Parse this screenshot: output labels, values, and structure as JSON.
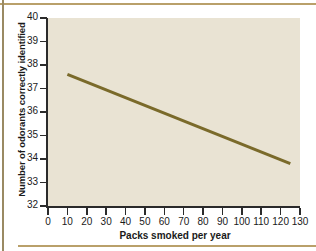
{
  "chart_data": {
    "type": "line",
    "title": "",
    "xlabel": "Packs smoked per year",
    "ylabel": "Number of odorants correctly identified",
    "xlim": [
      0,
      130
    ],
    "ylim": [
      32,
      40
    ],
    "xticks": [
      0,
      10,
      20,
      30,
      40,
      50,
      60,
      70,
      80,
      90,
      100,
      110,
      120,
      130
    ],
    "yticks": [
      32,
      33,
      34,
      35,
      36,
      37,
      38,
      39,
      40
    ],
    "xtick_labels": [
      "0",
      "10",
      "20",
      "30",
      "40",
      "50",
      "60",
      "70",
      "80",
      "90",
      "100",
      "110",
      "120",
      "130"
    ],
    "ytick_labels": [
      "32",
      "33",
      "34",
      "35",
      "36",
      "37",
      "38",
      "39",
      "40"
    ],
    "grid": false,
    "legend": null,
    "series": [
      {
        "name": "regression line",
        "color": "#7a6a2a",
        "x": [
          10,
          125
        ],
        "values": [
          37.6,
          33.8
        ]
      }
    ],
    "annotations": []
  },
  "style": {
    "plot_background": "#e9e3d3",
    "page_background": "#ffffff",
    "axis_color": "#2b2b2b",
    "line_color": "#7a6a2a",
    "rule_color": "#b9a06a"
  }
}
